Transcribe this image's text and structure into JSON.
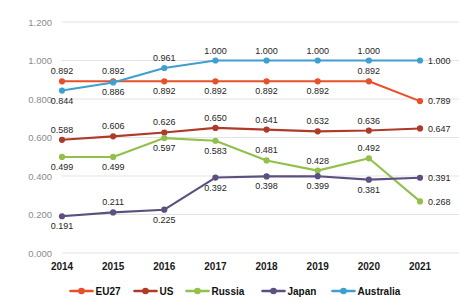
{
  "chart_data": {
    "type": "line",
    "title": "",
    "subtitle": "",
    "xlabel": "",
    "ylabel": "",
    "categories": [
      "2014",
      "2015",
      "2016",
      "2017",
      "2018",
      "2019",
      "2020",
      "2021"
    ],
    "ylim": [
      0.0,
      1.2
    ],
    "ytick_labels": [
      "0.000",
      "0.200",
      "0.400",
      "0.600",
      "0.800",
      "1.000",
      "1.200"
    ],
    "ytick_values": [
      0.0,
      0.2,
      0.4,
      0.6,
      0.8,
      1.0,
      1.2
    ],
    "grid": true,
    "legend_position": "bottom",
    "series": [
      {
        "name": "EU27",
        "color": "#e8502a",
        "values": [
          0.892,
          0.892,
          0.892,
          0.892,
          0.892,
          0.892,
          0.892,
          0.789
        ],
        "labels": [
          "0.892",
          "0.892",
          "0.892",
          "0.892",
          "0.892",
          "0.892",
          "0.892",
          "0.789"
        ],
        "label_pos": [
          "above",
          "above",
          "below",
          "below",
          "below",
          "below",
          "above",
          "right"
        ]
      },
      {
        "name": "US",
        "color": "#b03a2a",
        "values": [
          0.588,
          0.606,
          0.626,
          0.65,
          0.641,
          0.632,
          0.636,
          0.647
        ],
        "labels": [
          "0.588",
          "0.606",
          "0.626",
          "0.650",
          "0.641",
          "0.632",
          "0.636",
          "0.647"
        ],
        "label_pos": [
          "above",
          "above",
          "above",
          "above",
          "above",
          "above",
          "above",
          "right"
        ]
      },
      {
        "name": "Russia",
        "color": "#92c04a",
        "values": [
          0.499,
          0.499,
          0.597,
          0.583,
          0.481,
          0.428,
          0.492,
          0.268
        ],
        "labels": [
          "0.499",
          "0.499",
          "0.597",
          "0.583",
          "0.481",
          "0.428",
          "0.492",
          "0.268"
        ],
        "label_pos": [
          "below",
          "below",
          "below",
          "below",
          "above",
          "above",
          "above",
          "right"
        ]
      },
      {
        "name": "Japan",
        "color": "#5b5080",
        "values": [
          0.191,
          0.211,
          0.225,
          0.392,
          0.398,
          0.399,
          0.381,
          0.391
        ],
        "labels": [
          "0.191",
          "0.211",
          "0.225",
          "0.392",
          "0.398",
          "0.399",
          "0.381",
          "0.391"
        ],
        "label_pos": [
          "below",
          "above",
          "below",
          "below",
          "below",
          "below",
          "below",
          "right"
        ]
      },
      {
        "name": "Australia",
        "color": "#3f9fd0",
        "values": [
          0.844,
          0.886,
          0.961,
          1.0,
          1.0,
          1.0,
          1.0,
          1.0
        ],
        "labels": [
          "0.844",
          "0.886",
          "0.961",
          "1.000",
          "1.000",
          "1.000",
          "1.000",
          "1.000"
        ],
        "label_pos": [
          "below",
          "below",
          "above",
          "above",
          "above",
          "above",
          "above",
          "right"
        ]
      }
    ]
  },
  "legend": {
    "items": [
      {
        "label": "EU27",
        "color": "#e8502a"
      },
      {
        "label": "US",
        "color": "#b03a2a"
      },
      {
        "label": "Russia",
        "color": "#92c04a"
      },
      {
        "label": "Japan",
        "color": "#5b5080"
      },
      {
        "label": "Australia",
        "color": "#3f9fd0"
      }
    ]
  }
}
